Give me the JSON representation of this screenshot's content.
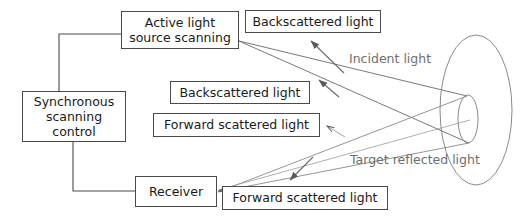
{
  "diagram": {
    "background_color": "#ffffff",
    "line_color": "#5a5a5a",
    "box_border_color": "#4a4a4a",
    "box_text_color": "#1a1a1a",
    "free_label_color": "#6f6f6f",
    "nodes": [
      {
        "id": "active_source",
        "label": "Active light\nsource scanning"
      },
      {
        "id": "sync_control",
        "label": "Synchronous\nscanning control"
      },
      {
        "id": "receiver",
        "label": "Receiver"
      },
      {
        "id": "backscattered_top",
        "label": "Backscattered light"
      },
      {
        "id": "backscattered_mid",
        "label": "Backscattered light"
      },
      {
        "id": "forward_scattered_mid",
        "label": "Forward scattered light"
      },
      {
        "id": "forward_scattered_bottom",
        "label": "Forward scattered light"
      }
    ],
    "free_labels": [
      {
        "id": "incident_light",
        "label": "Incident light"
      },
      {
        "id": "target_reflected_light",
        "label": "Target reflected light"
      }
    ],
    "target": {
      "id": "target_ellipse",
      "outer_shape": "ellipse",
      "inner_shape": "ellipse"
    }
  }
}
